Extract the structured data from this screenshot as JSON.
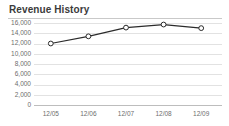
{
  "panel": {
    "title": "Revenue History"
  },
  "chart_data": {
    "type": "line",
    "title": "Revenue History",
    "xlabel": "",
    "ylabel": "",
    "categories": [
      "12/05",
      "12/06",
      "12/07",
      "12/08",
      "12/09"
    ],
    "series": [
      {
        "name": "Revenue",
        "values": [
          12000,
          13400,
          15100,
          15700,
          15000
        ]
      }
    ],
    "ylim": [
      0,
      16000
    ],
    "yticks": [
      16000,
      14000,
      12000,
      10000,
      8000,
      6000,
      4000,
      2000,
      0
    ],
    "ytick_labels": [
      "16,000",
      "14,000",
      "12,000",
      "10,000",
      "8,000",
      "6,000",
      "4,000",
      "2,000",
      "0"
    ],
    "grid": true,
    "legend": "none",
    "line_color": "#2b2b2b",
    "marker": "open-circle",
    "marker_fill": "#ffffff",
    "grid_color": "#e2e2e2"
  }
}
